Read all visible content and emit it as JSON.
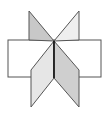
{
  "diagram": {
    "type": "geometric-figure",
    "colors": {
      "stroke": "#555555",
      "axis": "#111111",
      "rectangle_fill": "#ffffff",
      "dark_face": "#c8c8c8",
      "light_face": "#e6e6e6",
      "lighter_face": "#eeeeee"
    },
    "shapes": {
      "rectangle": {
        "x": 8,
        "y": 40,
        "w": 93,
        "h": 37
      },
      "top_left_triangle": {
        "points": "29,11 29,40 54,41"
      },
      "top_right_triangle": {
        "points": "79,11 54,41 79,40"
      },
      "bottom_left_parallelogram": {
        "points": "54,41 54,78 31,107 31,70"
      },
      "bottom_right_parallelogram": {
        "points": "54,41 79,70 79,107 54,78"
      },
      "axis_line": {
        "x1": 54,
        "y1": 41,
        "x2": 54,
        "y2": 78
      }
    }
  }
}
